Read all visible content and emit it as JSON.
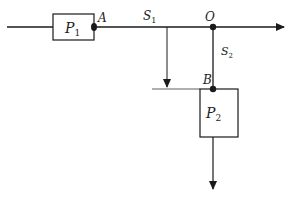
{
  "diagram": {
    "colors": {
      "stroke": "#1a1a1a",
      "background": "#ffffff"
    },
    "labels": {
      "P1": {
        "main": "P",
        "sub": "1"
      },
      "P2": {
        "main": "P",
        "sub": "2"
      },
      "S1": {
        "main": "S",
        "sub": "1"
      },
      "S2": {
        "main": "S",
        "sub": "2"
      },
      "A": "A",
      "O": "O",
      "B": "B"
    }
  }
}
